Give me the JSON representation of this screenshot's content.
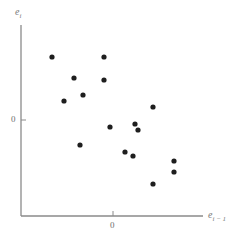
{
  "chart_data": {
    "type": "scatter",
    "title": "",
    "xlabel": "e_{i-1}",
    "ylabel": "e_i",
    "xlabel_parts": {
      "base": "e",
      "sub": "i − 1"
    },
    "ylabel_parts": {
      "base": "e",
      "sub": "i"
    },
    "x_ticks": [
      {
        "value": 0,
        "label": "0"
      }
    ],
    "y_ticks": [
      {
        "value": 0,
        "label": "0"
      }
    ],
    "grid": false,
    "legend": null,
    "units_note": "axes unlabeled except 0; values in relative units (≈10 px per unit)",
    "xlim": [
      -9.2,
      9.0
    ],
    "ylim": [
      -9.6,
      9.5
    ],
    "points": [
      {
        "x": -6.1,
        "y": 6.3
      },
      {
        "x": -0.9,
        "y": 6.3
      },
      {
        "x": -3.9,
        "y": 4.2
      },
      {
        "x": -0.9,
        "y": 4.0
      },
      {
        "x": -3.0,
        "y": 2.5
      },
      {
        "x": -4.9,
        "y": 1.9
      },
      {
        "x": 4.0,
        "y": 1.3
      },
      {
        "x": -0.3,
        "y": -0.7
      },
      {
        "x": 2.2,
        "y": -0.4
      },
      {
        "x": 2.5,
        "y": -1.0
      },
      {
        "x": -3.3,
        "y": -2.5
      },
      {
        "x": 1.2,
        "y": -3.2
      },
      {
        "x": 2.0,
        "y": -3.6
      },
      {
        "x": 6.1,
        "y": -4.1
      },
      {
        "x": 6.1,
        "y": -5.2
      },
      {
        "x": 4.0,
        "y": -6.4
      }
    ]
  },
  "labels": {
    "y_axis_base": "e",
    "y_axis_sub": "i",
    "x_axis_base": "e",
    "x_axis_sub": "i − 1",
    "x_zero": "0",
    "y_zero": "0"
  },
  "style": {
    "point_color": "#1e1e1e",
    "axis_color": "#8a8a8a"
  }
}
